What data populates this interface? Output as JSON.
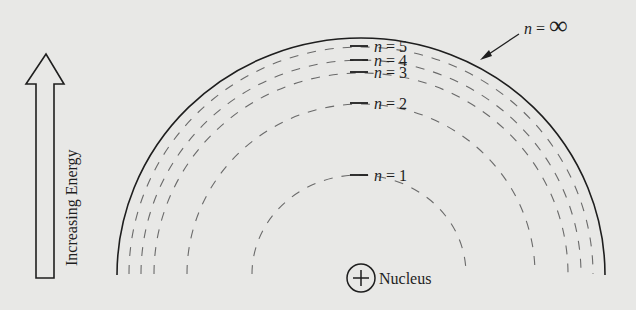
{
  "diagram": {
    "energy_axis_label": "Increasing Energy",
    "nucleus": {
      "symbol": "+",
      "label": "Nucleus"
    },
    "outer_boundary": {
      "label_var": "n",
      "label_eq": " = ",
      "label_val": "∞"
    },
    "levels": [
      {
        "n": "5",
        "var": "n",
        "eq": " = ",
        "val": "5"
      },
      {
        "n": "4",
        "var": "n",
        "eq": " = ",
        "val": "4"
      },
      {
        "n": "3",
        "var": "n",
        "eq": " = ",
        "val": "3"
      },
      {
        "n": "2",
        "var": "n",
        "eq": " = ",
        "val": "2"
      },
      {
        "n": "1",
        "var": "n",
        "eq": " = ",
        "val": "1"
      }
    ],
    "colors": {
      "background": "#e8e8e6",
      "ink": "#1e1e1e",
      "dash": "#6a6a6a"
    }
  }
}
